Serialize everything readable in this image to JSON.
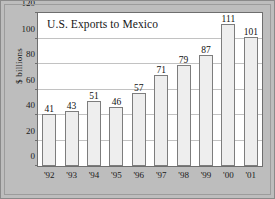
{
  "chart_data": {
    "type": "bar",
    "title": "U.S. Exports to Mexico",
    "xlabel": "",
    "ylabel": "$ billions",
    "categories": [
      "'92",
      "'93",
      "'94",
      "'95",
      "'96",
      "'97",
      "'98",
      "'99",
      "'00",
      "'01"
    ],
    "values": [
      41,
      43,
      51,
      46,
      57,
      71,
      79,
      87,
      111,
      101
    ],
    "value_labels": [
      "41",
      "43",
      "51",
      "46",
      "57",
      "71",
      "79",
      "87",
      "111",
      "101"
    ],
    "ylim": [
      0,
      120
    ],
    "yticks": [
      0,
      20,
      40,
      60,
      80,
      100,
      120
    ],
    "ytick_labels": [
      "0",
      "20",
      "40",
      "60",
      "80",
      "100",
      "120"
    ],
    "grid": true,
    "grid_axis": "y",
    "legend": false,
    "bar_fill_color": "#eeeeee",
    "bar_edge_color": "#7d7d7d",
    "plot_background_color": "#ffffff",
    "figure_background_color": "#bdbdbd",
    "gridline_color": "#c2c2c2",
    "axis_color": "#6e6e6e",
    "text_color": "#1a1a1a"
  }
}
